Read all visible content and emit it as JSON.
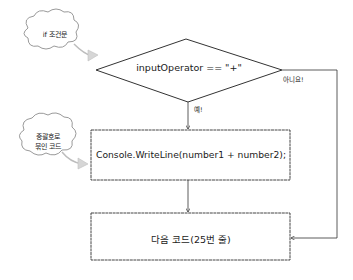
{
  "diagram": {
    "type": "flowchart",
    "condition": {
      "text": "inputOperator == \"+\"",
      "shape": "diamond"
    },
    "yes_label": "예!",
    "no_label": "아니요!",
    "process_box": {
      "text": "Console.WriteLine(number1 + number2);"
    },
    "next_box": {
      "text": "다음 코드(25번 줄)"
    },
    "annotations": [
      {
        "text": "if 조건문",
        "points_to": "condition"
      },
      {
        "text": "중괄호로\n묶인 코드",
        "line1": "중괄호로",
        "line2": "묶인 코드",
        "points_to": "process_box"
      }
    ],
    "colors": {
      "stroke": "#333333",
      "cloud_stroke": "#9a9a9a",
      "cloud_tail": "#d0d0d0",
      "background": "#ffffff"
    }
  }
}
